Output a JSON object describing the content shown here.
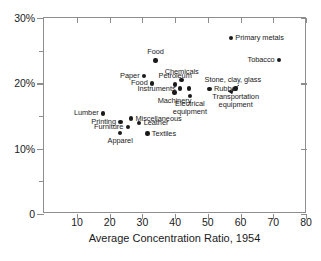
{
  "chart_data": {
    "type": "scatter",
    "title": "",
    "xlabel": "Average Concentration Ratio, 1954",
    "ylabel": "",
    "xlim": [
      3,
      80
    ],
    "ylim": [
      0,
      30
    ],
    "xticks": [
      10,
      20,
      30,
      40,
      50,
      60,
      70,
      80
    ],
    "xtick_labels": [
      "10",
      "20",
      "30",
      "40",
      "50",
      "60",
      "70",
      "80"
    ],
    "yticks": [
      0,
      5,
      10,
      15,
      20,
      25,
      30
    ],
    "ytick_labels": [
      "0",
      "",
      "10%",
      "",
      "20%",
      "",
      "30%"
    ],
    "ytick_major": [
      0,
      10,
      20,
      30
    ],
    "grid": false,
    "legend": "none",
    "points": [
      {
        "label": "Primary metals",
        "x": 57.0,
        "y": 26.9,
        "label_pos": "right"
      },
      {
        "label": "Tobacco",
        "x": 71.8,
        "y": 23.6,
        "label_pos": "left"
      },
      {
        "label": "Food",
        "x": 34.0,
        "y": 23.5,
        "label_pos": "above"
      },
      {
        "label": "Paper",
        "x": 30.5,
        "y": 21.1,
        "label_pos": "left"
      },
      {
        "label": "Chemicals",
        "x": 42.0,
        "y": 20.5,
        "label_pos": "above"
      },
      {
        "label": "Stone, clay, glass",
        "x": 44.3,
        "y": 19.2,
        "label_pos": "annotated"
      },
      {
        "label": "Petroleum",
        "x": 40.0,
        "y": 19.8,
        "label_pos": "above"
      },
      {
        "label": "Food",
        "x": 33.0,
        "y": 20.0,
        "label_pos": "left"
      },
      {
        "label": "Rubber",
        "x": 50.5,
        "y": 19.1,
        "label_pos": "right"
      },
      {
        "label": "Transportation equipment",
        "x": 58.5,
        "y": 19.2,
        "label_pos": "below2"
      },
      {
        "label": "Instruments",
        "x": 41.5,
        "y": 19.2,
        "label_pos": "left"
      },
      {
        "label": "Machinery",
        "x": 39.8,
        "y": 18.6,
        "label_pos": "below"
      },
      {
        "label": "Electrical equipment",
        "x": 44.5,
        "y": 18.1,
        "label_pos": "below2"
      },
      {
        "label": "Lumber",
        "x": 18.0,
        "y": 15.4,
        "label_pos": "left"
      },
      {
        "label": "Miscellaneous",
        "x": 26.5,
        "y": 14.6,
        "label_pos": "right"
      },
      {
        "label": "Printing",
        "x": 23.3,
        "y": 14.1,
        "label_pos": "left"
      },
      {
        "label": "Leather",
        "x": 29.0,
        "y": 13.9,
        "label_pos": "right"
      },
      {
        "label": "Furniture",
        "x": 25.5,
        "y": 13.3,
        "label_pos": "left"
      },
      {
        "label": "Apparel",
        "x": 23.2,
        "y": 12.4,
        "label_pos": "below"
      },
      {
        "label": "Textiles",
        "x": 31.5,
        "y": 12.3,
        "label_pos": "right"
      }
    ],
    "annotation": {
      "text": "Stone, clay, glass",
      "points_to": {
        "x": 44.3,
        "y": 19.2
      },
      "text_anchor": {
        "x": 49.0,
        "y": 20.5
      }
    },
    "colors": {
      "marker": "#1a1a1a",
      "axis": "#8e8e8e",
      "text": "#1a1a1a",
      "background": "#ffffff"
    }
  }
}
